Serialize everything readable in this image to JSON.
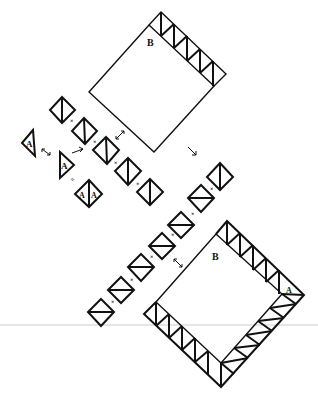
{
  "diagram": {
    "type": "quilt-block-assembly",
    "labels": {
      "block_a": "A",
      "block_b": "B",
      "multiply": "×",
      "equals": "="
    },
    "colors": {
      "line": "#111111",
      "background": "#ffffff",
      "rule": "#e6e6e6"
    },
    "top_square": {
      "label": "B",
      "corners": [
        [
          149,
          25
        ],
        [
          214,
          86
        ],
        [
          154,
          152
        ],
        [
          89,
          92
        ]
      ],
      "border_strip": {
        "side": "top-right",
        "units": 5
      }
    },
    "bottom_square": {
      "label": "B",
      "corner_label": "A",
      "corners": [
        [
          216,
          234
        ],
        [
          282,
          294
        ],
        [
          221,
          363
        ],
        [
          156,
          302
        ]
      ],
      "border_strips": [
        {
          "side": "top-right",
          "units": 5
        },
        {
          "side": "bottom-right",
          "units": 5
        },
        {
          "side": "bottom-left",
          "units": 5
        }
      ]
    },
    "upper_chain": {
      "units": 5,
      "seam": "vertical",
      "centers": [
        [
          62,
          110
        ],
        [
          84,
          131
        ],
        [
          106,
          150
        ],
        [
          128,
          171
        ],
        [
          150,
          192
        ]
      ]
    },
    "lower_chain": {
      "units": 7,
      "seam": "horizontal",
      "centers": [
        [
          101,
          312
        ],
        [
          121,
          290
        ],
        [
          141,
          267
        ],
        [
          162,
          246
        ],
        [
          181,
          225
        ],
        [
          201,
          198
        ],
        [
          220,
          177
        ]
      ]
    },
    "half_triangles": [
      {
        "label": "A",
        "points": [
          [
            33,
            130
          ],
          [
            22,
            143
          ],
          [
            35,
            156
          ]
        ]
      },
      {
        "label": "A",
        "points": [
          [
            60,
            152
          ],
          [
            74,
            165
          ],
          [
            60,
            178
          ]
        ]
      }
    ],
    "combined_unit": {
      "labels": [
        "A",
        "A"
      ],
      "center": [
        89,
        194
      ]
    },
    "arrows": [
      {
        "kind": "rotate",
        "at": [
          44,
          153
        ]
      },
      {
        "kind": "direction",
        "at": [
          78,
          150
        ]
      },
      {
        "kind": "rotate",
        "at": [
          120,
          135
        ]
      },
      {
        "kind": "direction",
        "at": [
          192,
          152
        ]
      },
      {
        "kind": "rotate",
        "at": [
          178,
          262
        ]
      }
    ]
  }
}
